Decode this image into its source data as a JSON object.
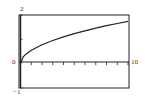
{
  "chart_data": {
    "type": "line",
    "title": "",
    "xlabel": "",
    "ylabel": "",
    "xlim": [
      0,
      10
    ],
    "ylim": [
      -1,
      2
    ],
    "grid": false,
    "x_tick_labels": [
      "0",
      "10"
    ],
    "y_tick_labels": [
      "-1",
      "2"
    ],
    "x_ticks": [
      1,
      2,
      3,
      4,
      5,
      6,
      7,
      8,
      9,
      10
    ],
    "y_ticks": [
      -1,
      1,
      2
    ],
    "series": [
      {
        "name": "f(x)",
        "x": [
          0,
          0.25,
          0.5,
          1,
          2,
          3,
          4,
          5,
          6,
          7,
          8,
          9,
          10
        ],
        "y": [
          0,
          0.28,
          0.39,
          0.55,
          0.78,
          0.95,
          1.1,
          1.23,
          1.35,
          1.46,
          1.56,
          1.65,
          1.74
        ]
      }
    ]
  },
  "labels": {
    "ymax": "2",
    "ymin": "−1",
    "xmin": "0",
    "xmax": "10"
  }
}
